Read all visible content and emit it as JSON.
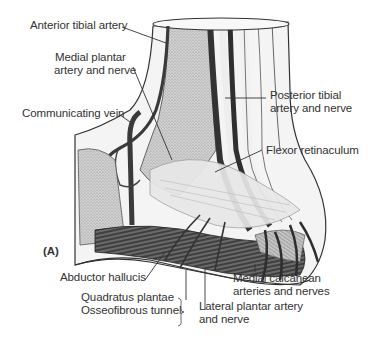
{
  "figure": {
    "panel_label": "(A)",
    "labels": {
      "anterior_tibial_artery": "Anterior tibial artery",
      "medial_plantar_1": "Medial plantar",
      "medial_plantar_2": "artery and nerve",
      "communicating_vein": "Communicating vein",
      "posterior_tibial_1": "Posterior tibial",
      "posterior_tibial_2": "artery and nerve",
      "flexor_retinaculum": "Flexor retinaculum",
      "abductor_hallucis": "Abductor hallucis",
      "quadratus_plantae": "Quadratus plantae",
      "osseofibrous_tunnel": "Osseofibrous tunnel",
      "lateral_plantar_1": "Lateral plantar artery",
      "lateral_plantar_2": "and nerve",
      "medial_calcanean_1": "Medial calcanean",
      "medial_calcanean_2": "arteries and nerves"
    }
  },
  "colors": {
    "background": "#ffffff",
    "ink": "#2a2a2a",
    "stipple": "#bdbdbd",
    "vessel": "#3a3a3a",
    "retinaculum": "#e6e6e6"
  }
}
